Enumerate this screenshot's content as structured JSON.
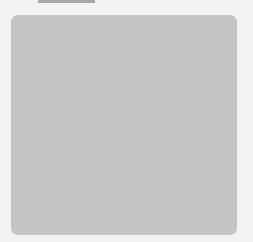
{
  "board": {
    "background": "#c4c4c4",
    "grid_x": [
      30,
      56,
      81,
      106,
      131,
      156,
      182,
      207
    ],
    "grid_y": [
      17,
      42,
      67,
      92,
      116,
      140,
      164,
      189,
      212
    ],
    "right_edge": 237,
    "stone_radius": 12
  },
  "stones": [
    {
      "color": "black",
      "x": 81,
      "y": 140,
      "label": ""
    },
    {
      "color": "white",
      "x": 106,
      "y": 140,
      "label": ""
    },
    {
      "color": "white",
      "x": 131,
      "y": 140,
      "label": ""
    },
    {
      "color": "white",
      "x": 156,
      "y": 140,
      "label": ""
    },
    {
      "color": "black",
      "x": 106,
      "y": 164,
      "label": ""
    },
    {
      "color": "black",
      "x": 131,
      "y": 164,
      "label": "1"
    },
    {
      "color": "black",
      "x": 156,
      "y": 164,
      "label": ""
    }
  ]
}
